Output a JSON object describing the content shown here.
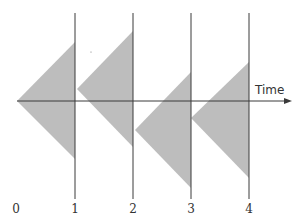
{
  "diagram": {
    "axis_label": "Time",
    "tick_labels": [
      "0",
      "1",
      "2",
      "3",
      "4"
    ],
    "colors": {
      "triangle_fill": "#bdbdbd",
      "line": "#3a3a3a",
      "text": "#333333",
      "background": "#ffffff"
    },
    "axis": {
      "y": 101,
      "x_start": 17,
      "x_end": 292
    },
    "vertical_lines": [
      {
        "x": 75,
        "y1": 13,
        "y2": 199
      },
      {
        "x": 133,
        "y1": 13,
        "y2": 199
      },
      {
        "x": 191,
        "y1": 13,
        "y2": 199
      },
      {
        "x": 249,
        "y1": 13,
        "y2": 199
      }
    ],
    "tick_label_positions": [
      16,
      75,
      133,
      191,
      249
    ],
    "triangles": [
      {
        "apex": [
          17,
          101
        ],
        "top": [
          75,
          42
        ],
        "bottom": [
          75,
          159
        ]
      },
      {
        "apex": [
          77,
          89
        ],
        "top": [
          133,
          31
        ],
        "bottom": [
          133,
          147
        ]
      },
      {
        "apex": [
          135,
          130
        ],
        "top": [
          191,
          72
        ],
        "bottom": [
          191,
          188
        ]
      },
      {
        "apex": [
          191,
          118
        ],
        "top": [
          249,
          62
        ],
        "bottom": [
          249,
          178
        ]
      }
    ]
  }
}
